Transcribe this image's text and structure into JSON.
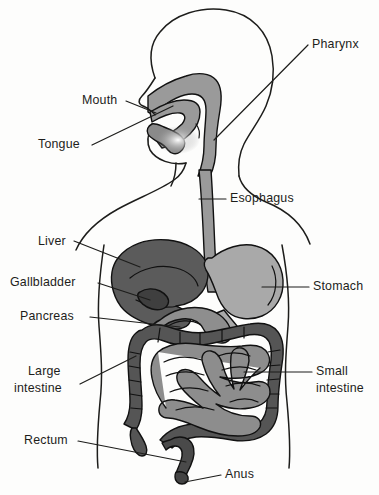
{
  "diagram": {
    "type": "anatomical-illustration",
    "background_color": "#fdfdfc",
    "outline_color": "#1d1d1b"
  },
  "palette": {
    "liver": "#5b5b5b",
    "gallbladder": "#3f3f3f",
    "stomach": "#a9a9a9",
    "pancreas": "#8e8e8e",
    "large_intestine": "#555555",
    "small_intestine": "#8d8d8d",
    "esophagus": "#9a9a9a",
    "pharynx": "#9a9a9a",
    "tongue": "#8a8a8a",
    "rectum": "#4a4a4a",
    "anus": "#444444"
  },
  "labels": [
    {
      "id": "pharynx",
      "text": "Pharynx",
      "line2": "",
      "x": 312,
      "y": 48,
      "anchor": "start"
    },
    {
      "id": "mouth",
      "text": "Mouth",
      "line2": "",
      "x": 82,
      "y": 104,
      "anchor": "start"
    },
    {
      "id": "tongue",
      "text": "Tongue",
      "line2": "",
      "x": 38,
      "y": 148,
      "anchor": "start"
    },
    {
      "id": "esophagus",
      "text": "Esophagus",
      "line2": "",
      "x": 230,
      "y": 202,
      "anchor": "start"
    },
    {
      "id": "liver",
      "text": "Liver",
      "line2": "",
      "x": 38,
      "y": 245,
      "anchor": "start"
    },
    {
      "id": "gallbladder",
      "text": "Gallbladder",
      "line2": "",
      "x": 10,
      "y": 286,
      "anchor": "start"
    },
    {
      "id": "stomach",
      "text": "Stomach",
      "line2": "",
      "x": 313,
      "y": 290,
      "anchor": "start"
    },
    {
      "id": "pancreas",
      "text": "Pancreas",
      "line2": "",
      "x": 20,
      "y": 320,
      "anchor": "start"
    },
    {
      "id": "large-intestine",
      "text": "Large",
      "line2": "intestine",
      "x": 28,
      "y": 375,
      "anchor": "start"
    },
    {
      "id": "small-intestine",
      "text": "Small",
      "line2": "intestine",
      "x": 316,
      "y": 375,
      "anchor": "start"
    },
    {
      "id": "rectum",
      "text": "Rectum",
      "line2": "",
      "x": 24,
      "y": 444,
      "anchor": "start"
    },
    {
      "id": "anus",
      "text": "Anus",
      "line2": "",
      "x": 225,
      "y": 478,
      "anchor": "start"
    }
  ],
  "organs": [
    {
      "id": "pharynx",
      "name": "Pharynx"
    },
    {
      "id": "mouth",
      "name": "Mouth"
    },
    {
      "id": "tongue",
      "name": "Tongue"
    },
    {
      "id": "esophagus",
      "name": "Esophagus"
    },
    {
      "id": "liver",
      "name": "Liver"
    },
    {
      "id": "gallbladder",
      "name": "Gallbladder"
    },
    {
      "id": "stomach",
      "name": "Stomach"
    },
    {
      "id": "pancreas",
      "name": "Pancreas"
    },
    {
      "id": "large-intestine",
      "name": "Large intestine"
    },
    {
      "id": "small-intestine",
      "name": "Small intestine"
    },
    {
      "id": "rectum",
      "name": "Rectum"
    },
    {
      "id": "anus",
      "name": "Anus"
    }
  ]
}
